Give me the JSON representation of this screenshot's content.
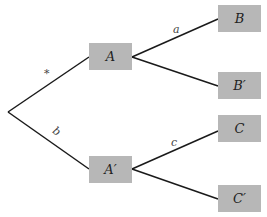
{
  "diagram": {
    "type": "tree",
    "colors": {
      "node_fill": "#b7b7b7",
      "edge": "#1a1a1a",
      "text": "#222222"
    },
    "root": {
      "x": 8,
      "y": 112
    },
    "nodes": [
      {
        "id": "A",
        "label": "A",
        "x": 89,
        "y": 43,
        "w": 43,
        "h": 27
      },
      {
        "id": "A2",
        "label": "A′",
        "x": 89,
        "y": 156,
        "w": 43,
        "h": 27
      },
      {
        "id": "B",
        "label": "B",
        "x": 218,
        "y": 5,
        "w": 43,
        "h": 27
      },
      {
        "id": "B2",
        "label": "B′",
        "x": 218,
        "y": 72,
        "w": 43,
        "h": 27
      },
      {
        "id": "C",
        "label": "C",
        "x": 218,
        "y": 115,
        "w": 43,
        "h": 27
      },
      {
        "id": "C2",
        "label": "C′",
        "x": 218,
        "y": 185,
        "w": 43,
        "h": 27
      }
    ],
    "edges": [
      {
        "from": "root",
        "to": "A",
        "label": "*"
      },
      {
        "from": "root",
        "to": "A2",
        "label": "b"
      },
      {
        "from": "A",
        "to": "B",
        "label": "a"
      },
      {
        "from": "A",
        "to": "B2",
        "label": ""
      },
      {
        "from": "A2",
        "to": "C",
        "label": "c"
      },
      {
        "from": "A2",
        "to": "C2",
        "label": ""
      }
    ],
    "edge_labels": {
      "root_A": {
        "text": "*",
        "x": 44,
        "y": 68
      },
      "root_A2": {
        "text": "b",
        "x": 53,
        "y": 126
      },
      "A_B": {
        "text": "a",
        "x": 173,
        "y": 24
      },
      "A2_C": {
        "text": "c",
        "x": 171,
        "y": 137
      }
    }
  }
}
